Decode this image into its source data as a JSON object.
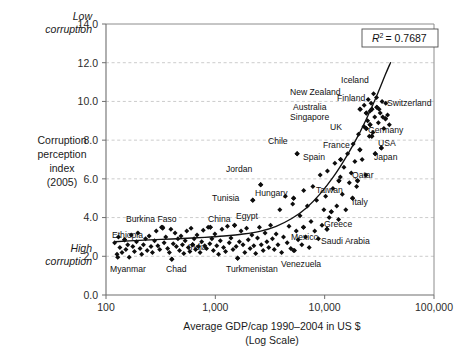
{
  "chart_data": {
    "type": "scatter",
    "title": "",
    "xlabel": "Average GDP/cap 1990–2004 in US $",
    "xlabel_line2": "(Log Scale)",
    "ylabel_lines": [
      "Corruption",
      "perception",
      "index",
      "(2005)"
    ],
    "annotation_top_left_lines": [
      "Low",
      "corruption"
    ],
    "annotation_bottom_left_lines": [
      "High",
      "corruption"
    ],
    "r2_label": "R",
    "r2_sup": "2",
    "r2_value": "= 0.7687",
    "xscale": "log",
    "xlim": [
      100,
      100000
    ],
    "ylim": [
      0,
      14
    ],
    "grid": true,
    "legend": "none",
    "xticks": [
      100,
      1000,
      10000,
      100000
    ],
    "xtick_labels": [
      "100",
      "1,000",
      "10,000",
      "100,000"
    ],
    "yticks": [
      0,
      2,
      4,
      6,
      8,
      10,
      12,
      14
    ],
    "ytick_labels": [
      "0.0",
      "2.0",
      "4.0",
      "6.0",
      "8.0",
      "10.0",
      "12.0",
      "14.0"
    ],
    "colors": {
      "point": "#0d0d0d",
      "trend": "#111111",
      "grid": "#b4b4b4",
      "axis": "#6e6e6e",
      "background": "#ffffff"
    },
    "trend_curve": {
      "description": "exponential fit of corruption perception index vs log GDP per capita",
      "points": [
        [
          120,
          2.75
        ],
        [
          200,
          2.82
        ],
        [
          320,
          2.87
        ],
        [
          500,
          2.92
        ],
        [
          800,
          2.98
        ],
        [
          1200,
          3.05
        ],
        [
          1800,
          3.15
        ],
        [
          2600,
          3.3
        ],
        [
          3600,
          3.55
        ],
        [
          5000,
          3.95
        ],
        [
          6800,
          4.5
        ],
        [
          9000,
          5.2
        ],
        [
          12000,
          6.1
        ],
        [
          16000,
          7.2
        ],
        [
          21000,
          8.4
        ],
        [
          26000,
          9.5
        ],
        [
          31000,
          10.5
        ],
        [
          36000,
          11.4
        ],
        [
          40000,
          12.0
        ]
      ]
    },
    "labeled_points": [
      {
        "name": "Ethiopia",
        "x": 148,
        "y": 2.85,
        "lx": 112,
        "ly": 238,
        "anchor": "start"
      },
      {
        "name": "Myanmar",
        "x": 128,
        "y": 1.95,
        "lx": 110,
        "ly": 272,
        "anchor": "start"
      },
      {
        "name": "Burkina Faso",
        "x": 330,
        "y": 3.5,
        "lx": 126,
        "ly": 222,
        "anchor": "start"
      },
      {
        "name": "Chad",
        "x": 400,
        "y": 1.85,
        "lx": 166,
        "ly": 272,
        "anchor": "start"
      },
      {
        "name": "China",
        "x": 900,
        "y": 3.5,
        "lx": 208,
        "ly": 222,
        "anchor": "start"
      },
      {
        "name": "India",
        "x": 620,
        "y": 2.6,
        "lx": 188,
        "ly": 250,
        "anchor": "start"
      },
      {
        "name": "Egypt",
        "x": 1500,
        "y": 3.6,
        "lx": 236,
        "ly": 219,
        "anchor": "start"
      },
      {
        "name": "Turkmenistan",
        "x": 1600,
        "y": 1.9,
        "lx": 226,
        "ly": 272,
        "anchor": "start"
      },
      {
        "name": "Tunisia",
        "x": 2200,
        "y": 4.9,
        "lx": 212,
        "ly": 201,
        "anchor": "start"
      },
      {
        "name": "Jordan",
        "x": 2600,
        "y": 5.7,
        "lx": 226,
        "ly": 172,
        "anchor": "start"
      },
      {
        "name": "Hungary",
        "x": 5200,
        "y": 5.0,
        "lx": 255,
        "ly": 196,
        "anchor": "start"
      },
      {
        "name": "Mexico",
        "x": 6400,
        "y": 3.5,
        "lx": 291,
        "ly": 240,
        "anchor": "start"
      },
      {
        "name": "Venezuela",
        "x": 5200,
        "y": 2.3,
        "lx": 281,
        "ly": 267,
        "anchor": "start"
      },
      {
        "name": "Saudi Arabia",
        "x": 10500,
        "y": 3.4,
        "lx": 321,
        "ly": 244,
        "anchor": "start"
      },
      {
        "name": "Greece",
        "x": 11500,
        "y": 4.3,
        "lx": 324,
        "ly": 227,
        "anchor": "start"
      },
      {
        "name": "Taiwan",
        "x": 13500,
        "y": 5.9,
        "lx": 316,
        "ly": 193,
        "anchor": "start"
      },
      {
        "name": "Italy",
        "x": 18000,
        "y": 5.0,
        "lx": 352,
        "ly": 205,
        "anchor": "start"
      },
      {
        "name": "Qatar",
        "x": 20000,
        "y": 5.9,
        "lx": 352,
        "ly": 178,
        "anchor": "start"
      },
      {
        "name": "Chile",
        "x": 5600,
        "y": 7.3,
        "lx": 268,
        "ly": 144,
        "anchor": "start"
      },
      {
        "name": "Spain",
        "x": 14000,
        "y": 7.0,
        "lx": 303,
        "ly": 160,
        "anchor": "start"
      },
      {
        "name": "France",
        "x": 21000,
        "y": 7.5,
        "lx": 323,
        "ly": 148,
        "anchor": "start"
      },
      {
        "name": "Japan",
        "x": 29000,
        "y": 7.3,
        "lx": 374,
        "ly": 160,
        "anchor": "start"
      },
      {
        "name": "USA",
        "x": 33000,
        "y": 7.6,
        "lx": 378,
        "ly": 146,
        "anchor": "start"
      },
      {
        "name": "Germany",
        "x": 27000,
        "y": 8.2,
        "lx": 368,
        "ly": 133,
        "anchor": "start"
      },
      {
        "name": "UK",
        "x": 24000,
        "y": 8.6,
        "lx": 330,
        "ly": 130,
        "anchor": "start"
      },
      {
        "name": "Singapore",
        "x": 24000,
        "y": 9.4,
        "lx": 290,
        "ly": 120,
        "anchor": "start"
      },
      {
        "name": "Australia",
        "x": 26000,
        "y": 8.8,
        "lx": 293,
        "ly": 110,
        "anchor": "start"
      },
      {
        "name": "Finland",
        "x": 27000,
        "y": 9.6,
        "lx": 337,
        "ly": 101,
        "anchor": "start"
      },
      {
        "name": "New Zealand",
        "x": 21000,
        "y": 9.6,
        "lx": 290,
        "ly": 95,
        "anchor": "start"
      },
      {
        "name": "Iceland",
        "x": 30000,
        "y": 9.7,
        "lx": 341,
        "ly": 83,
        "anchor": "start"
      },
      {
        "name": "Switzerland",
        "x": 36000,
        "y": 9.1,
        "lx": 387,
        "ly": 106,
        "anchor": "start"
      }
    ],
    "scatter_points": [
      [
        120,
        2.7
      ],
      [
        126,
        2.1
      ],
      [
        130,
        3.0
      ],
      [
        134,
        2.45
      ],
      [
        140,
        2.2
      ],
      [
        148,
        2.85
      ],
      [
        152,
        2.35
      ],
      [
        158,
        2.6
      ],
      [
        163,
        1.95
      ],
      [
        170,
        3.1
      ],
      [
        176,
        2.5
      ],
      [
        182,
        2.25
      ],
      [
        190,
        2.75
      ],
      [
        196,
        3.2
      ],
      [
        205,
        2.4
      ],
      [
        212,
        2.1
      ],
      [
        220,
        2.6
      ],
      [
        230,
        2.9
      ],
      [
        238,
        2.3
      ],
      [
        248,
        3.05
      ],
      [
        258,
        2.5
      ],
      [
        266,
        2.2
      ],
      [
        278,
        2.8
      ],
      [
        288,
        3.3
      ],
      [
        298,
        2.55
      ],
      [
        310,
        2.35
      ],
      [
        322,
        3.5
      ],
      [
        330,
        3.45
      ],
      [
        340,
        2.7
      ],
      [
        352,
        3.0
      ],
      [
        366,
        2.4
      ],
      [
        380,
        2.2
      ],
      [
        392,
        3.4
      ],
      [
        400,
        1.85
      ],
      [
        412,
        2.65
      ],
      [
        428,
        3.2
      ],
      [
        440,
        2.5
      ],
      [
        455,
        2.9
      ],
      [
        470,
        2.3
      ],
      [
        485,
        3.05
      ],
      [
        500,
        2.6
      ],
      [
        515,
        2.15
      ],
      [
        530,
        2.8
      ],
      [
        548,
        3.3
      ],
      [
        566,
        2.45
      ],
      [
        585,
        2.25
      ],
      [
        600,
        3.45
      ],
      [
        620,
        2.6
      ],
      [
        640,
        2.9
      ],
      [
        660,
        2.35
      ],
      [
        680,
        3.1
      ],
      [
        700,
        2.5
      ],
      [
        725,
        2.2
      ],
      [
        750,
        2.75
      ],
      [
        775,
        3.35
      ],
      [
        800,
        2.55
      ],
      [
        830,
        2.4
      ],
      [
        860,
        3.5
      ],
      [
        890,
        2.65
      ],
      [
        900,
        3.5
      ],
      [
        930,
        2.9
      ],
      [
        960,
        2.3
      ],
      [
        990,
        3.15
      ],
      [
        1030,
        2.55
      ],
      [
        1070,
        2.1
      ],
      [
        1110,
        2.8
      ],
      [
        1150,
        3.4
      ],
      [
        1190,
        2.45
      ],
      [
        1240,
        2.25
      ],
      [
        1290,
        3.55
      ],
      [
        1340,
        2.7
      ],
      [
        1390,
        2.95
      ],
      [
        1450,
        2.35
      ],
      [
        1500,
        3.6
      ],
      [
        1550,
        2.5
      ],
      [
        1600,
        1.9
      ],
      [
        1660,
        2.75
      ],
      [
        1720,
        3.3
      ],
      [
        1790,
        2.6
      ],
      [
        1860,
        2.2
      ],
      [
        1930,
        3.45
      ],
      [
        2000,
        2.85
      ],
      [
        2080,
        2.4
      ],
      [
        2160,
        3.1
      ],
      [
        2200,
        4.9
      ],
      [
        2250,
        2.55
      ],
      [
        2340,
        2.15
      ],
      [
        2430,
        2.95
      ],
      [
        2530,
        3.5
      ],
      [
        2600,
        5.7
      ],
      [
        2630,
        2.6
      ],
      [
        2740,
        2.3
      ],
      [
        2850,
        3.2
      ],
      [
        2960,
        2.75
      ],
      [
        3080,
        2.45
      ],
      [
        3200,
        3.6
      ],
      [
        3330,
        2.9
      ],
      [
        3460,
        2.35
      ],
      [
        3600,
        3.15
      ],
      [
        3740,
        2.6
      ],
      [
        3890,
        4.4
      ],
      [
        4040,
        2.2
      ],
      [
        4200,
        3.0
      ],
      [
        4370,
        5.1
      ],
      [
        4540,
        2.7
      ],
      [
        4720,
        3.55
      ],
      [
        4900,
        2.4
      ],
      [
        5100,
        4.7
      ],
      [
        5200,
        5.0
      ],
      [
        5300,
        2.3
      ],
      [
        5500,
        3.3
      ],
      [
        5600,
        7.3
      ],
      [
        5720,
        2.85
      ],
      [
        5950,
        4.1
      ],
      [
        6180,
        2.6
      ],
      [
        6400,
        3.5
      ],
      [
        6430,
        5.4
      ],
      [
        6680,
        3.0
      ],
      [
        6950,
        4.6
      ],
      [
        7220,
        2.45
      ],
      [
        7500,
        3.8
      ],
      [
        7800,
        5.6
      ],
      [
        8110,
        3.3
      ],
      [
        8430,
        4.9
      ],
      [
        8760,
        2.9
      ],
      [
        9100,
        6.2
      ],
      [
        9460,
        3.6
      ],
      [
        9830,
        4.4
      ],
      [
        10200,
        5.1
      ],
      [
        10500,
        3.4
      ],
      [
        10600,
        6.4
      ],
      [
        11000,
        4.0
      ],
      [
        11500,
        4.3
      ],
      [
        11900,
        5.5
      ],
      [
        12400,
        6.8
      ],
      [
        12900,
        4.6
      ],
      [
        13400,
        3.9
      ],
      [
        13500,
        5.9
      ],
      [
        13900,
        6.1
      ],
      [
        14000,
        7.0
      ],
      [
        14500,
        5.2
      ],
      [
        15000,
        6.6
      ],
      [
        15600,
        4.4
      ],
      [
        16200,
        7.3
      ],
      [
        16800,
        5.8
      ],
      [
        17500,
        6.3
      ],
      [
        18000,
        5.0
      ],
      [
        18200,
        7.8
      ],
      [
        18900,
        6.9
      ],
      [
        19600,
        5.6
      ],
      [
        20000,
        5.9
      ],
      [
        20400,
        8.3
      ],
      [
        21000,
        7.5
      ],
      [
        21200,
        9.6
      ],
      [
        22000,
        7.0
      ],
      [
        22900,
        8.7
      ],
      [
        23800,
        6.2
      ],
      [
        24000,
        8.6
      ],
      [
        24100,
        9.4
      ],
      [
        24700,
        9.0
      ],
      [
        25600,
        8.2
      ],
      [
        26000,
        8.8
      ],
      [
        26600,
        9.9
      ],
      [
        27000,
        9.6
      ],
      [
        27600,
        8.4
      ],
      [
        28700,
        9.2
      ],
      [
        29000,
        7.3
      ],
      [
        29800,
        10.2
      ],
      [
        30000,
        9.7
      ],
      [
        31000,
        8.9
      ],
      [
        32200,
        9.4
      ],
      [
        33000,
        7.6
      ],
      [
        33500,
        10.0
      ],
      [
        34800,
        8.6
      ],
      [
        36000,
        9.1
      ],
      [
        36200,
        9.9
      ],
      [
        37600,
        9.3
      ],
      [
        39000,
        8.8
      ],
      [
        27000,
        8.2
      ],
      [
        26000,
        9.5
      ],
      [
        23000,
        9.8
      ],
      [
        25000,
        10.1
      ],
      [
        28000,
        10.4
      ],
      [
        31500,
        9.6
      ],
      [
        34000,
        9.2
      ]
    ]
  }
}
